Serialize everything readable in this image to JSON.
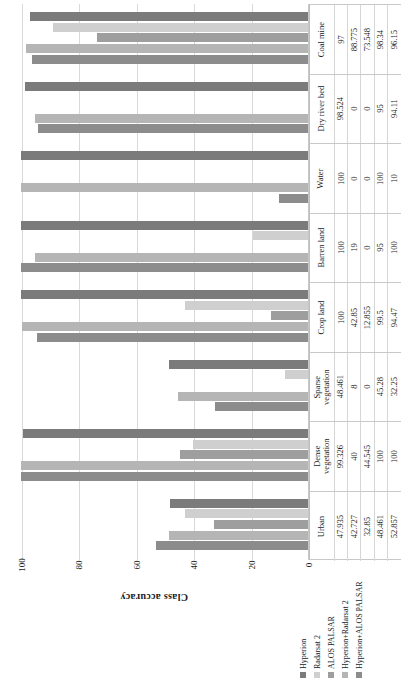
{
  "chart_data": {
    "type": "bar",
    "title": "",
    "orientation": "horizontal",
    "ylabel": "Class accuracy",
    "xlabel": "",
    "ylim": [
      0,
      100
    ],
    "ticks": [
      "100",
      "80",
      "60",
      "40",
      "20",
      "0"
    ],
    "grid": true,
    "legend_position": "bottom-right",
    "categories": [
      "Coal mine",
      "Dry river bed",
      "Water",
      "Barren land",
      "Crop land",
      "Sparse vegetation",
      "Dense vegetation",
      "Urban"
    ],
    "series": [
      {
        "name": "Hyperion",
        "color": "#7b7b7b",
        "values": [
          97,
          98.524,
          100,
          100,
          100,
          48.461,
          99.326,
          47.935
        ]
      },
      {
        "name": "Radarsat 2",
        "color": "#cfcfcf",
        "values": [
          88.775,
          0,
          0,
          19,
          42.85,
          8,
          40,
          42.727
        ]
      },
      {
        "name": "ALOS PALSAR",
        "color": "#9e9e9e",
        "values": [
          73.548,
          0,
          0,
          0,
          12.855,
          0,
          44.545,
          32.85
        ]
      },
      {
        "name": "Hyperion+Radarsat 2",
        "color": "#b5b5b5",
        "values": [
          98.34,
          95,
          100,
          95,
          99.5,
          45.28,
          100,
          48.461
        ]
      },
      {
        "name": "Hyperion+ALOS PALSAR",
        "color": "#8c8c8c",
        "values": [
          96.15,
          94.11,
          10,
          100,
          94.47,
          32.25,
          100,
          52.857
        ]
      }
    ],
    "table": {
      "row_labels": [
        "Hyperion",
        "Radarsat 2",
        "ALOS PALSAR",
        "Hyperion+Radarsat 2",
        "Hyperion+ALOS PALSAR"
      ],
      "columns": [
        {
          "header": "Coal mine",
          "cells": [
            "97",
            "88.775",
            "73.548",
            "98.34",
            "96.15"
          ]
        },
        {
          "header": "Dry river bed",
          "cells": [
            "98.524",
            "0",
            "0",
            "95",
            "94.11"
          ]
        },
        {
          "header": "Water",
          "cells": [
            "100",
            "0",
            "0",
            "100",
            "10"
          ]
        },
        {
          "header": "Barren land",
          "cells": [
            "100",
            "19",
            "0",
            "95",
            "100"
          ]
        },
        {
          "header": "Crop land",
          "cells": [
            "100",
            "42.85",
            "12.855",
            "99.5",
            "94.47"
          ]
        },
        {
          "header": "Sparse\nvegetation",
          "cells": [
            "48.461",
            "8",
            "0",
            "45.28",
            "32.25"
          ]
        },
        {
          "header": "Dense\nvegetation",
          "cells": [
            "99.326",
            "40",
            "44.545",
            "100",
            "100"
          ]
        },
        {
          "header": "Urban",
          "cells": [
            "47.935",
            "42.727",
            "32.85",
            "48.461",
            "52.857"
          ]
        }
      ]
    },
    "legend": [
      {
        "label": "Hyperion",
        "color": "#7b7b7b"
      },
      {
        "label": "Radarsat 2",
        "color": "#cfcfcf"
      },
      {
        "label": "ALOS PALSAR",
        "color": "#9e9e9e"
      },
      {
        "label": "Hyperion+Radarsat 2",
        "color": "#b5b5b5"
      },
      {
        "label": "Hyperion+ALOS PALSAR",
        "color": "#8c8c8c"
      }
    ]
  }
}
